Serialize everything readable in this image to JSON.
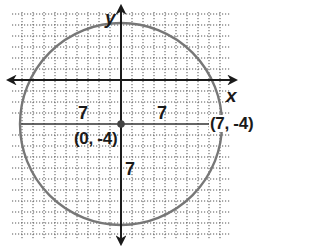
{
  "diagram": {
    "type": "coordinate-plane-circle",
    "axes": {
      "x_label": "x",
      "y_label": "y"
    },
    "grid": {
      "spacing_px": 11,
      "style": "dotted"
    },
    "circle": {
      "center": "(0, -4)",
      "radius": 7,
      "color": "#777777"
    },
    "points": [
      {
        "label": "(0, -4)",
        "role": "center"
      },
      {
        "label": "(7, -4)",
        "role": "point-on-circle"
      }
    ],
    "radius_labels": [
      "7",
      "7",
      "7"
    ],
    "colors": {
      "axis": "#1a1a1a",
      "grid": "#555555",
      "circle": "#777777",
      "point": "#444444"
    }
  }
}
